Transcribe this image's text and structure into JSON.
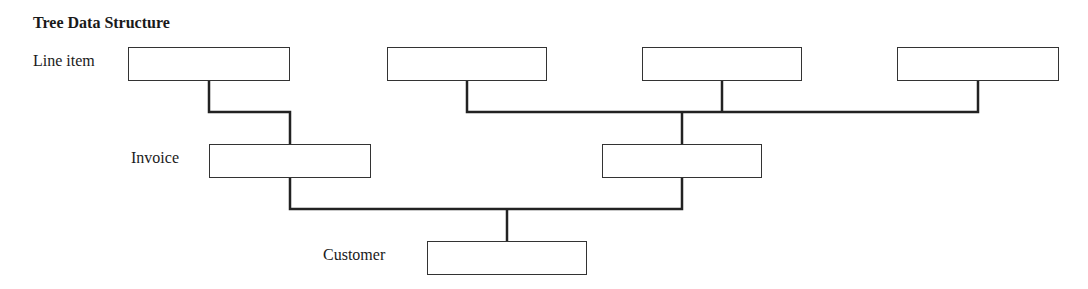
{
  "title": "Tree Data Structure",
  "levels": {
    "line_item": "Line item",
    "invoice": "Invoice",
    "customer": "Customer"
  },
  "nodes": {
    "line_items": [
      {
        "x": 128,
        "y": 47,
        "w": 162,
        "h": 33
      },
      {
        "x": 387,
        "y": 47,
        "w": 160,
        "h": 33
      },
      {
        "x": 642,
        "y": 47,
        "w": 160,
        "h": 33
      },
      {
        "x": 897,
        "y": 47,
        "w": 162,
        "h": 33
      }
    ],
    "invoices": [
      {
        "x": 209,
        "y": 144,
        "w": 162,
        "h": 33
      },
      {
        "x": 602,
        "y": 144,
        "w": 160,
        "h": 33
      }
    ],
    "customer": {
      "x": 427,
      "y": 241,
      "w": 160,
      "h": 33
    }
  },
  "line_color": "#222222"
}
